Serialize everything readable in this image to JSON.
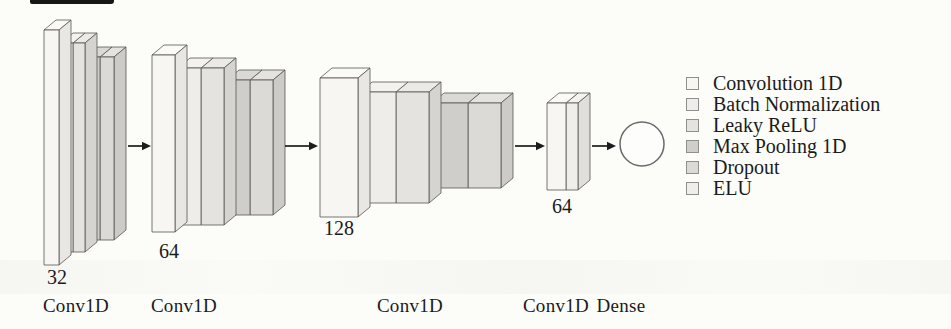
{
  "diagram": {
    "blocks": [
      {
        "name": "conv-block-1",
        "filters": "32",
        "caption": "Conv1D",
        "layers": [
          "conv",
          "batchnorm",
          "leakyrelu",
          "maxpool",
          "dropout"
        ]
      },
      {
        "name": "conv-block-2",
        "filters": "64",
        "caption": "Conv1D",
        "layers": [
          "conv",
          "batchnorm",
          "leakyrelu",
          "maxpool",
          "dropout"
        ]
      },
      {
        "name": "conv-block-3",
        "filters": "128",
        "caption": "Conv1D",
        "layers": [
          "conv",
          "batchnorm",
          "leakyrelu",
          "maxpool",
          "dropout"
        ]
      },
      {
        "name": "conv-block-4",
        "filters": "64",
        "caption": "Conv1D",
        "layers": [
          "conv",
          "elu"
        ]
      },
      {
        "name": "dense-layer",
        "caption": "Dense"
      }
    ]
  },
  "legend": {
    "items": [
      {
        "type": "conv",
        "label": "Convolution 1D"
      },
      {
        "type": "batchnorm",
        "label": "Batch Normalization"
      },
      {
        "type": "leakyrelu",
        "label": "Leaky ReLU"
      },
      {
        "type": "maxpool",
        "label": "Max Pooling 1D"
      },
      {
        "type": "dropout",
        "label": "Dropout"
      },
      {
        "type": "elu",
        "label": "ELU"
      }
    ]
  },
  "palette": {
    "layers": {
      "conv": {
        "front": "#f7f6f2",
        "top": "#fbfaf6",
        "side": "#e8e7e3"
      },
      "batchnorm": {
        "front": "#eeede9",
        "top": "#f3f2ee",
        "side": "#dfdeda"
      },
      "leakyrelu": {
        "front": "#e4e3df",
        "top": "#ebeae6",
        "side": "#d5d4d0"
      },
      "maxpool": {
        "front": "#cfcecb",
        "top": "#dad9d6",
        "side": "#c0bfbc"
      },
      "dropout": {
        "front": "#dbdad6",
        "top": "#e4e3df",
        "side": "#cccbc7"
      },
      "elu": {
        "front": "#efeeea",
        "top": "#f4f3ef",
        "side": "#e0dfdb"
      }
    },
    "outline": "#575757",
    "arrow": "#1c1c1c",
    "text": "#1b1b1b",
    "node_fill": "#fdfdfb",
    "node_stroke": "#6b6b6b"
  }
}
